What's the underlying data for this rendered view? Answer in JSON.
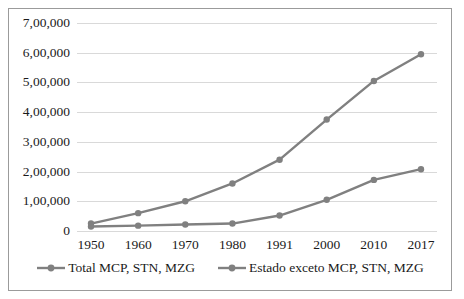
{
  "chart_data": {
    "type": "line",
    "title": "",
    "subtitle": "",
    "xlabel": "",
    "ylabel": "",
    "categories": [
      "1950",
      "1960",
      "1970",
      "1980",
      "1991",
      "2000",
      "2010",
      "2017"
    ],
    "ylim": [
      0,
      700000
    ],
    "ytick_labels": [
      "0",
      "1,00,000",
      "2,00,000",
      "3,00,000",
      "4,00,000",
      "5,00,000",
      "6,00,000",
      "7,00,000"
    ],
    "ytick_values": [
      0,
      100000,
      200000,
      300000,
      400000,
      500000,
      600000,
      700000
    ],
    "grid": "horizontal",
    "legend_position": "bottom",
    "series": [
      {
        "name": "Total MCP, STN, MZG",
        "color": "#808080",
        "marker": "circle",
        "values": [
          25000,
          60000,
          100000,
          160000,
          240000,
          375000,
          505000,
          595000
        ]
      },
      {
        "name": "Estado exceto MCP, STN, MZG",
        "color": "#808080",
        "marker": "circle",
        "values": [
          15000,
          18000,
          22000,
          25000,
          52000,
          105000,
          172000,
          208000
        ]
      }
    ]
  },
  "style": {
    "line_color": "#808080",
    "grid_color": "#d9d9d9",
    "border_color": "#9b9b9b",
    "text_color": "#1a1a1a",
    "background": "#ffffff"
  }
}
